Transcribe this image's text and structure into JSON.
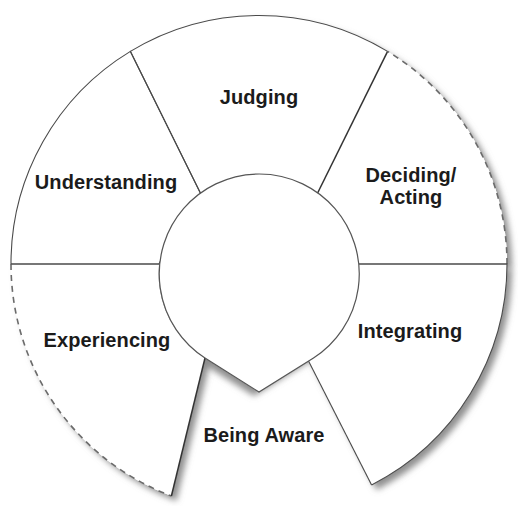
{
  "diagram": {
    "type": "circular-process-wheel",
    "title": "",
    "background_color": "#ffffff",
    "geometry": {
      "center_x": 259,
      "center_y": 264,
      "inner_radius": 100,
      "outer_radius": 248,
      "notch_radius": 133,
      "notch_vertex_x": 205,
      "notch_vertex_y": 358
    },
    "colors": {
      "stroke_thin": "#4a4a4a",
      "stroke_mid": "#333333",
      "stroke_dashed": "#6b6b6b",
      "shadow": "#8c8c8c",
      "text": "#1b1b1b",
      "fill": "#ffffff"
    },
    "hub": {
      "name": "center-hub",
      "label": ""
    },
    "segments": [
      {
        "id": "judging",
        "label": "Judging",
        "start_angle": 59,
        "end_angle": 119,
        "outer_arc_style": "solid-thin",
        "leading_edge_style": "thick-shadow",
        "trailing_edge_style": "thin",
        "label_x": 259,
        "label_y": 97
      },
      {
        "id": "deciding-acting",
        "label": "Deciding/\nActing",
        "start_angle": 0,
        "end_angle": 59,
        "outer_arc_style": "dashed",
        "leading_edge_style": "thin",
        "trailing_edge_style": "thick-shadow",
        "label_x": 411,
        "label_y": 186
      },
      {
        "id": "integrating",
        "label": "Integrating",
        "start_angle": -63,
        "end_angle": 0,
        "outer_arc_style": "solid-shadow",
        "leading_edge_style": "thin",
        "trailing_edge_style": "thin",
        "label_x": 410,
        "label_y": 331
      },
      {
        "id": "being-aware",
        "label": "Being Aware",
        "start_angle": -117,
        "end_angle": -63,
        "outer_arc_style": "open",
        "leading_edge_style": "open",
        "trailing_edge_style": "open",
        "label_x": 264,
        "label_y": 435
      },
      {
        "id": "experiencing",
        "label": "Experiencing",
        "start_angle": -180,
        "end_angle": -117,
        "outer_arc_style": "dashed",
        "leading_edge_style": "thick-shadow",
        "trailing_edge_style": "thin",
        "label_x": 107,
        "label_y": 340
      },
      {
        "id": "understanding",
        "label": "Understanding",
        "start_angle": 119,
        "end_angle": 180,
        "outer_arc_style": "solid-thin",
        "leading_edge_style": "thin",
        "trailing_edge_style": "thin",
        "label_x": 106,
        "label_y": 182
      }
    ]
  }
}
